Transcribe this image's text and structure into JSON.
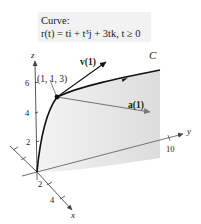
{
  "caption": {
    "title": "Curve:",
    "formula": "r(t) = ti + t³j + 3tk, t ≥ 0"
  },
  "axes": {
    "z": {
      "label": "z",
      "ticks": [
        "6",
        "4",
        "2"
      ]
    },
    "x": {
      "label": "x",
      "ticks": [
        "2",
        "4"
      ]
    },
    "y": {
      "label": "y",
      "ticks": [
        "10"
      ]
    }
  },
  "curve": {
    "label": "C"
  },
  "point": {
    "label": "(1, 1, 3)"
  },
  "vectors": {
    "velocity": {
      "label": "v(1)"
    },
    "acceleration": {
      "label": "a(1)"
    }
  },
  "colors": {
    "curve": "#111111",
    "axis": "#444444",
    "shading": "#e6e6e6",
    "accel_vector": "#777777",
    "caption_bg": "#f2f2f2"
  }
}
